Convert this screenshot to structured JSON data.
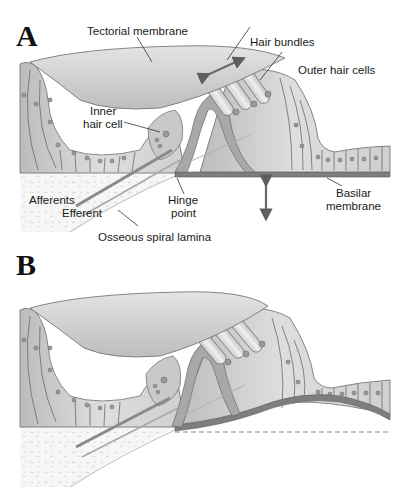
{
  "figure": {
    "panels": [
      {
        "letter": "A",
        "labels": {
          "tectorial_membrane": "Tectorial membrane",
          "hair_bundles": "Hair bundles",
          "outer_hair_cells": "Outer hair cells",
          "inner_hair_cell_line1": "Inner",
          "inner_hair_cell_line2": "hair cell",
          "afferents": "Afferents",
          "efferent": "Efferent",
          "hinge_point_line1": "Hinge",
          "hinge_point_line2": "point",
          "basilar_membrane_line1": "Basilar",
          "basilar_membrane_line2": "membrane",
          "osseous_spiral_lamina": "Osseous spiral lamina"
        },
        "arrows": {
          "shear_arrow": "double-headed-diagonal-arrow",
          "vertical_arrow": "double-headed-vertical-arrow"
        }
      },
      {
        "letter": "B",
        "state": "basilar membrane deflected upward",
        "reference_line": "dashed-resting-position-line"
      }
    ],
    "colors": {
      "tissue_light": "#d8d8d8",
      "tissue_mid": "#b5b5b5",
      "tissue_dark": "#8a8a8a",
      "membrane_dark": "#6e6e6e",
      "outline": "#5a5a5a",
      "bone": "#f4f4f4",
      "arrow": "#6a6a6a"
    }
  }
}
